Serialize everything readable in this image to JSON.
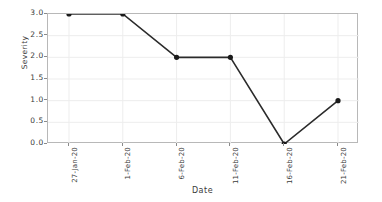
{
  "chart_data": {
    "type": "line",
    "title": "",
    "xlabel": "Date",
    "ylabel": "Severity",
    "categories": [
      "27-Jan-20",
      "1-Feb-20",
      "6-Feb-20",
      "11-Feb-20",
      "16-Feb-20",
      "21-Feb-20"
    ],
    "values": [
      3.0,
      3.0,
      2.0,
      2.0,
      0.0,
      1.0
    ],
    "series": [
      {
        "name": "Severity",
        "values": [
          3.0,
          3.0,
          2.0,
          2.0,
          0.0,
          1.0
        ]
      }
    ],
    "ylim": [
      0.0,
      3.0
    ],
    "yticks": [
      "0.0",
      "0.5",
      "1.0",
      "1.5",
      "2.0",
      "2.5",
      "3.0"
    ],
    "ytick_values": [
      0.0,
      0.5,
      1.0,
      1.5,
      2.0,
      2.5,
      3.0
    ],
    "xtick_labels": [
      "27-Jan-20",
      "1-Feb-20",
      "6-Feb-20",
      "11-Feb-20",
      "16-Feb-20",
      "21-Feb-20"
    ],
    "xtick_rotation": -90,
    "grid": true,
    "legend": null,
    "line_color": "#2b2b2b",
    "marker": "circle",
    "marker_color": "#1a1a1a",
    "grid_color": "#ededed",
    "axes_color": "#b8b8b8",
    "background_color": "#ffffff"
  }
}
